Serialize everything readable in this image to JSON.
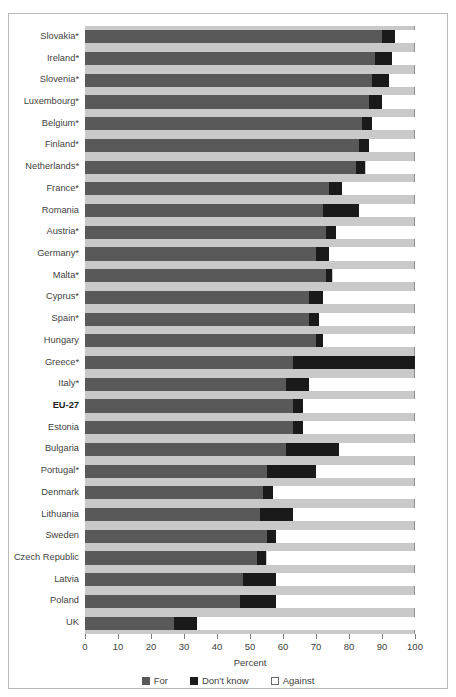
{
  "figure": {
    "caption": ""
  },
  "chart_data": {
    "type": "bar",
    "orientation": "horizontal",
    "stacked": true,
    "title": "",
    "xlabel": "Percent",
    "ylabel": "",
    "xlim": [
      0,
      100
    ],
    "xticks": [
      0,
      10,
      20,
      30,
      40,
      50,
      60,
      70,
      80,
      90,
      100
    ],
    "grid": false,
    "legend_position": "bottom",
    "series": [
      {
        "name": "For",
        "color": "#595959",
        "values": [
          90,
          88,
          87,
          86,
          84,
          83,
          82,
          74,
          72,
          73,
          70,
          73,
          68,
          68,
          70,
          63,
          61,
          63,
          63,
          61,
          55,
          54,
          53,
          55,
          52,
          48,
          47,
          27
        ]
      },
      {
        "name": "Don't know",
        "color": "#1a1a1a",
        "values": [
          4,
          5,
          5,
          4,
          3,
          3,
          3,
          4,
          11,
          3,
          4,
          2,
          4,
          3,
          2,
          37,
          7,
          3,
          3,
          16,
          15,
          3,
          10,
          3,
          3,
          10,
          11,
          7
        ]
      },
      {
        "name": "Against",
        "color": "#ffffff",
        "values": [
          6,
          7,
          8,
          10,
          13,
          14,
          15,
          22,
          17,
          24,
          26,
          25,
          28,
          29,
          28,
          0,
          32,
          34,
          34,
          23,
          30,
          43,
          37,
          42,
          45,
          42,
          42,
          66
        ]
      }
    ],
    "categories": [
      "Slovakia*",
      "Ireland*",
      "Slovenia*",
      "Luxembourg*",
      "Belgium*",
      "Finland*",
      "Netherlands*",
      "France*",
      "Romania",
      "Austria*",
      "Germany*",
      "Malta*",
      "Cyprus*",
      "Spain*",
      "Hungary",
      "Greece*",
      "Italy*",
      "EU-27",
      "Estonia",
      "Bulgaria",
      "Portugal*",
      "Denmark",
      "Lithuania",
      "Sweden",
      "Czech Republic",
      "Latvia",
      "Poland",
      "UK"
    ],
    "emphasized_categories": [
      "EU-27"
    ]
  },
  "legend": {
    "items": [
      {
        "label": "For",
        "swatch": "legend-swatch-for"
      },
      {
        "label": "Don't know",
        "swatch": "legend-swatch-dont-know"
      },
      {
        "label": "Against",
        "swatch": "legend-swatch-against"
      }
    ]
  },
  "colors": {
    "for": "#595959",
    "dont_know": "#1a1a1a",
    "against": "#ffffff",
    "plot_background": "#c9c9c9",
    "frame_border": "#b9b9b9"
  }
}
